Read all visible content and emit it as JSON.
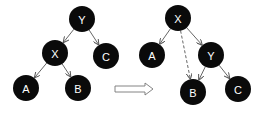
{
  "diagram": {
    "colors": {
      "node_fill": "#0a0a0a",
      "node_text": "#ffffff",
      "edge": "#555555",
      "arrow_stroke": "#777777"
    },
    "node_radius": 13,
    "before": {
      "nodes": [
        {
          "id": "Y",
          "label": "Y",
          "x": 82,
          "y": 19
        },
        {
          "id": "X",
          "label": "X",
          "x": 55,
          "y": 53
        },
        {
          "id": "C",
          "label": "C",
          "x": 106,
          "y": 56
        },
        {
          "id": "A",
          "label": "A",
          "x": 26,
          "y": 88
        },
        {
          "id": "B",
          "label": "B",
          "x": 78,
          "y": 88
        }
      ],
      "edges": [
        {
          "from": "Y",
          "to": "X",
          "style": "solid"
        },
        {
          "from": "Y",
          "to": "C",
          "style": "solid"
        },
        {
          "from": "X",
          "to": "A",
          "style": "solid"
        },
        {
          "from": "X",
          "to": "B",
          "style": "solid"
        }
      ]
    },
    "transition_arrow": {
      "x1": 115,
      "x2": 153,
      "y": 89
    },
    "after": {
      "nodes": [
        {
          "id": "X",
          "label": "X",
          "x": 178,
          "y": 18
        },
        {
          "id": "A",
          "label": "A",
          "x": 152,
          "y": 55
        },
        {
          "id": "Y",
          "label": "Y",
          "x": 211,
          "y": 55
        },
        {
          "id": "B",
          "label": "B",
          "x": 193,
          "y": 92
        },
        {
          "id": "C",
          "label": "C",
          "x": 238,
          "y": 89
        }
      ],
      "edges": [
        {
          "from": "X",
          "to": "A",
          "style": "solid"
        },
        {
          "from": "X",
          "to": "Y",
          "style": "solid"
        },
        {
          "from": "X",
          "to": "B",
          "style": "dashed"
        },
        {
          "from": "Y",
          "to": "B",
          "style": "solid"
        },
        {
          "from": "Y",
          "to": "C",
          "style": "solid"
        }
      ]
    }
  }
}
